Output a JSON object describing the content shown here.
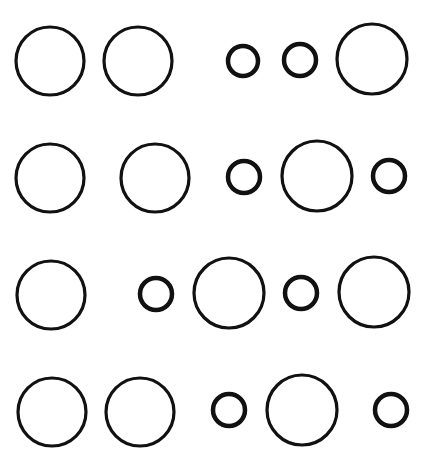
{
  "header": {
    "clipped_text": ""
  },
  "stroke_color": "#111111",
  "circles": [
    {
      "row": 1,
      "cx": 50,
      "cy": 61,
      "r": 34,
      "size": "large"
    },
    {
      "row": 1,
      "cx": 138,
      "cy": 61,
      "r": 34,
      "size": "large"
    },
    {
      "row": 1,
      "cx": 243,
      "cy": 61,
      "r": 15,
      "size": "small"
    },
    {
      "row": 1,
      "cx": 300,
      "cy": 60,
      "r": 16,
      "size": "small"
    },
    {
      "row": 1,
      "cx": 372,
      "cy": 59,
      "r": 35,
      "size": "large"
    },
    {
      "row": 2,
      "cx": 50,
      "cy": 178,
      "r": 34,
      "size": "large"
    },
    {
      "row": 2,
      "cx": 155,
      "cy": 178,
      "r": 34,
      "size": "large"
    },
    {
      "row": 2,
      "cx": 244,
      "cy": 177,
      "r": 16,
      "size": "small"
    },
    {
      "row": 2,
      "cx": 317,
      "cy": 176,
      "r": 35,
      "size": "large"
    },
    {
      "row": 2,
      "cx": 389,
      "cy": 176,
      "r": 16,
      "size": "small"
    },
    {
      "row": 3,
      "cx": 51,
      "cy": 295,
      "r": 34,
      "size": "large"
    },
    {
      "row": 3,
      "cx": 156,
      "cy": 294,
      "r": 16,
      "size": "small"
    },
    {
      "row": 3,
      "cx": 229,
      "cy": 293,
      "r": 35,
      "size": "large"
    },
    {
      "row": 3,
      "cx": 301,
      "cy": 293,
      "r": 16,
      "size": "small"
    },
    {
      "row": 3,
      "cx": 374,
      "cy": 292,
      "r": 35,
      "size": "large"
    },
    {
      "row": 4,
      "cx": 52,
      "cy": 412,
      "r": 34,
      "size": "large"
    },
    {
      "row": 4,
      "cx": 140,
      "cy": 412,
      "r": 34,
      "size": "large"
    },
    {
      "row": 4,
      "cx": 229,
      "cy": 410,
      "r": 16,
      "size": "small"
    },
    {
      "row": 4,
      "cx": 302,
      "cy": 410,
      "r": 35,
      "size": "large"
    },
    {
      "row": 4,
      "cx": 391,
      "cy": 410,
      "r": 16,
      "size": "small"
    }
  ]
}
